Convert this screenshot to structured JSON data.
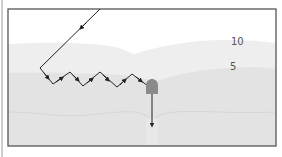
{
  "diagram": {
    "type": "cross-section",
    "labels": {
      "upper_layer": "10",
      "middle_layer": "5"
    },
    "colors": {
      "frame": "#555555",
      "ray": "#222222",
      "dome": "#8a8a8a",
      "layer_top": "#ffffff",
      "layer_10": "#ebebeb",
      "layer_5": "#e2e2e2",
      "layer_bottom": "#dcdcdc"
    },
    "elements": [
      {
        "name": "incoming-ray",
        "description": "straight line entering from top with arrow pointing down-left"
      },
      {
        "name": "zigzag-path",
        "description": "zigzag path with arrows travelling right along layer boundary"
      },
      {
        "name": "dome",
        "description": "gray dome-shaped receiver"
      },
      {
        "name": "downward-arrow",
        "description": "vertical arrow pointing down from dome"
      }
    ]
  }
}
